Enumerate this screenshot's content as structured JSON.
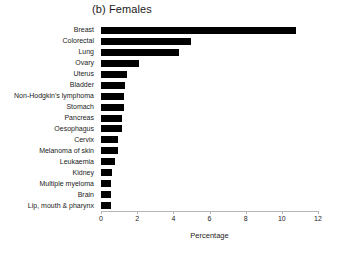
{
  "chart_data": {
    "type": "bar",
    "orientation": "horizontal",
    "title": "(b) Females",
    "xlabel": "Percentage",
    "ylabel": "",
    "xlim": [
      0,
      12
    ],
    "xticks": [
      0,
      2,
      4,
      6,
      8,
      10,
      12
    ],
    "grid": false,
    "legend": null,
    "bar_color": "#000000",
    "axis_color": "#b5b5b5",
    "categories": [
      "Breast",
      "Colorectal",
      "Lung",
      "Ovary",
      "Uterus",
      "Bladder",
      "Non-Hodgkin's lymphoma",
      "Stomach",
      "Pancreas",
      "Oesophagus",
      "Cervix",
      "Melanoma of skin",
      "Leukaemia",
      "Kidney",
      "Multiple myeloma",
      "Brain",
      "Lip, mouth & pharynx"
    ],
    "values": [
      10.8,
      5.0,
      4.3,
      2.1,
      1.45,
      1.3,
      1.25,
      1.25,
      1.15,
      1.15,
      0.95,
      0.95,
      0.8,
      0.6,
      0.55,
      0.55,
      0.55
    ]
  }
}
